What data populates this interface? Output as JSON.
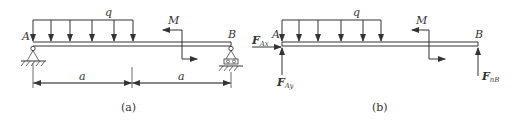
{
  "figure_a": {
    "caption": "(a)",
    "load_label": "q",
    "moment_label": "M",
    "point_a_label": "A",
    "point_b_label": "B",
    "dim_left_label": "a",
    "dim_right_label": "a"
  },
  "figure_b": {
    "caption": "(b)",
    "load_label": "q",
    "moment_label": "M",
    "point_a_label": "A",
    "point_b_label": "B",
    "fax_label": "F",
    "fax_sub": "Ax",
    "fay_label": "F",
    "fay_sub": "Ay",
    "fnb_label": "F",
    "fnb_sub": "nB"
  },
  "colors": {
    "line": "#333333",
    "background": "#ffffff"
  }
}
